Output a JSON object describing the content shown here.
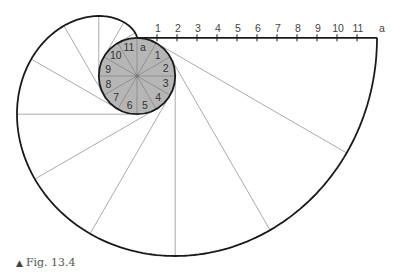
{
  "figure": {
    "caption_marker": "▲",
    "caption": "Fig. 13.4"
  },
  "circle": {
    "center": [
      137,
      76
    ],
    "radius": 38.2,
    "fill": "#b6b6b6",
    "divisions": 12,
    "point_labels": [
      "a",
      "1",
      "2",
      "3",
      "4",
      "5",
      "6",
      "7",
      "8",
      "9",
      "10",
      "11"
    ]
  },
  "scale_line": {
    "start_label": "",
    "labels": [
      "1",
      "2",
      "3",
      "4",
      "5",
      "6",
      "7",
      "8",
      "9",
      "10",
      "11",
      "a"
    ],
    "length_px": 240
  },
  "colors": {
    "outline": "#1a1a1a",
    "construction": "#aaaaaa",
    "radial": "#8c8c8c",
    "text": "#333333"
  }
}
